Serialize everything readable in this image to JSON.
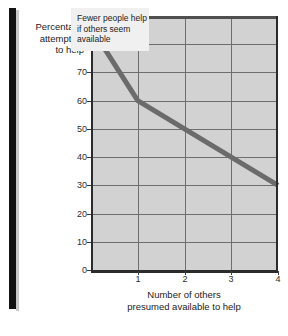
{
  "figure": {
    "background_color": "#ffffff",
    "plot_background_color": "#d2d2d2",
    "series_color": "#6b6b6b",
    "rule_color": "#131313"
  },
  "chart_data": {
    "type": "line",
    "title": "",
    "xlabel": "Number of others presumed available to help",
    "xlabel_lines": [
      "Number of others",
      "presumed available to help"
    ],
    "ylabel": "Percentage attempting to help",
    "ylabel_lines": [
      "Percentage",
      "attempting",
      "to help"
    ],
    "xlim": [
      0,
      4
    ],
    "ylim": [
      0,
      90
    ],
    "xticks": [
      0,
      1,
      2,
      3,
      4
    ],
    "xticklabels": [
      "",
      "1",
      "2",
      "3",
      "4"
    ],
    "yticks": [
      0,
      10,
      20,
      30,
      40,
      50,
      60,
      70,
      80,
      90
    ],
    "yticklabels": [
      "0",
      "10",
      "20",
      "30",
      "40",
      "50",
      "60",
      "70",
      "80",
      "90"
    ],
    "grid": true,
    "legend": false,
    "series": [
      {
        "name": "Percentage attempting to help",
        "x": [
          0,
          1,
          4
        ],
        "values": [
          86,
          60,
          30
        ]
      }
    ],
    "annotations": [
      {
        "text": "Fewer people help if others seem available",
        "lines": [
          "Fewer people help",
          "if others seem",
          "available"
        ],
        "x": 1.5,
        "y": 82
      }
    ]
  }
}
